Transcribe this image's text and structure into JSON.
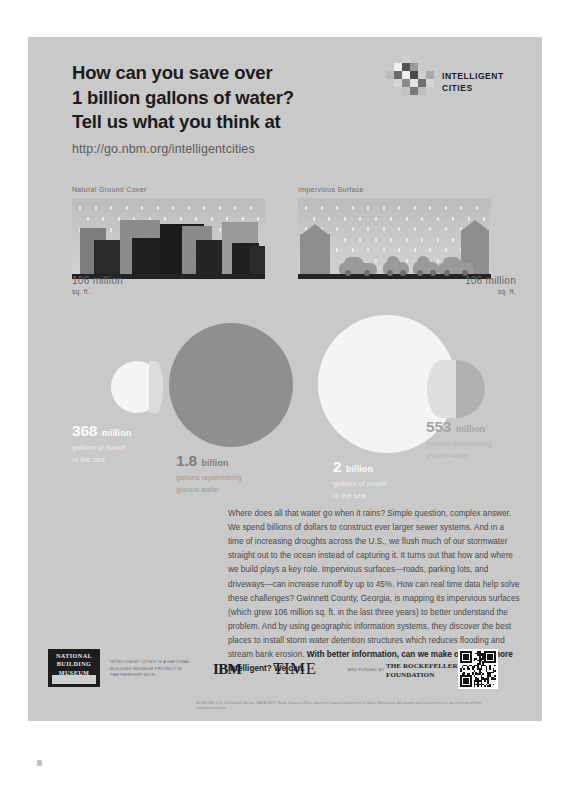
{
  "header": {
    "headline": "How can you save over\n1 billion gallons of water?\nTell us what you think at",
    "url": "http://go.nbm.org/intelligentcities",
    "brand_line1": "INTELLIGENT",
    "brand_line2": "CITIES"
  },
  "scenes": [
    {
      "title": "Natural Ground Cover",
      "stat_value": "106 million",
      "stat_unit": "sq. ft."
    },
    {
      "title": "Impervious Surface",
      "stat_value": "106 million",
      "stat_unit": "sq. ft."
    }
  ],
  "circles": [
    {
      "value": "368",
      "unit": "million",
      "sub1": "gallons of runoff",
      "sub2": "to the sea"
    },
    {
      "value": "1.8",
      "unit": "billion",
      "sub1": "gallons replenishing",
      "sub2": "ground water"
    },
    {
      "value": "2",
      "unit": "billion",
      "sub1": "gallons of runoff",
      "sub2": "to the sea"
    },
    {
      "value": "553",
      "unit": "million",
      "sub1": "gallons replenishing",
      "sub2": "ground water"
    }
  ],
  "body": {
    "paragraph": "Where does all that water go when it rains? Simple question, complex answer. We spend billions of dollars to construct ever larger sewer systems. And in a time of increasing droughts across the U.S., we flush much of our stormwater straight out to the ocean instead of capturing it. It turns out that how and where we build plays a key role. Impervious surfaces—roads, parking lots, and driveways—can increase runoff by up to 45%. How can real time data help solve these challenges? Gwinnett County, Georgia, is mapping its impervious surfaces (which grew 106 million sq. ft. in the last three years) to better understand the problem. And by using geographic information systems, they discover the best places to install storm water detention structures which reduces flooding and stream bank erosion. ",
    "paragraph_bold": "With better information, can we make our cities more intelligent? We can."
  },
  "footer": {
    "nbm_logo": "NATIONAL BUILDING MUSEUM",
    "nbm_note": "Intelligent Cities is a National Building Museum project in partnership with",
    "ibm_logo": "IBM",
    "time_logo": "TIME",
    "funded_by": "And funded by",
    "rockefeller_line1": "THE ROCKEFELLER",
    "rockefeller_line2": "FOUNDATION",
    "credits": "SOURCES: U.S. Geological Survey, NASA NSTC Earth Science Office, Gwinnett County Department of Water Resources. All content and trademarks are the property of their respective owners."
  },
  "colors": {
    "poster_bg": "#c9c9c9",
    "ink": "#1b1b1b",
    "runoff_white": "#f4f4f4",
    "groundwater_dark": "#8f8f8f",
    "groundwater_lite": "#b0b0b0"
  }
}
